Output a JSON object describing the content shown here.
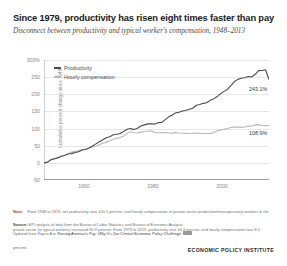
{
  "header": {
    "title": "Since 1979, productivity has risen eight times faster than pay",
    "subtitle": "Disconnect between productivity and typical worker's compensation, 1948–2013"
  },
  "legend": {
    "items": [
      {
        "label": "Productivity",
        "color": "#4d4d4d"
      },
      {
        "label": "Hourly compensation",
        "color": "#b8b8b8"
      }
    ]
  },
  "end_labels": {
    "productivity": "243.1%",
    "compensation": "108.9%"
  },
  "notes": {
    "lead": "Note:",
    "body": "From 1948 to 1973, net productivity rose 100.1 percent, and hourly compensation of private-sector production/nonsupervisory workers in the private sector (or typical workers) increased 90.9 percent. From 1979 to 2013, productivity rose 64.9 percent, and hourly compensation rose 8.2 percent."
  },
  "source": {
    "lead": "Source:",
    "body": "EPI analysis of data from the Bureau of Labor Statistics and Bureau of Economic Analysis"
  },
  "updated": {
    "prefix": "Updated from Figure A in",
    "em": "Raising America's Pay: Why It's Our Central Economic Policy Challenge"
  },
  "logo": "ECONOMIC POLICY INSTITUTE",
  "chart_data": {
    "type": "line",
    "title": "Since 1979, productivity has risen eight times faster than pay",
    "subtitle": "Disconnect between productivity and typical worker's compensation, 1948–2013",
    "xlabel": "",
    "ylabel": "Cumulative percent change since 1948",
    "xlim": [
      1948,
      2013
    ],
    "ylim": [
      -50,
      300
    ],
    "yticks": [
      -50,
      0,
      50,
      100,
      150,
      200,
      250,
      300
    ],
    "ytick_labels": [
      "-50",
      "0",
      "50",
      "100",
      "150",
      "200",
      "250",
      "300%"
    ],
    "xticks": [
      1960,
      1980,
      2000
    ],
    "xtick_labels": [
      "1960",
      "1980",
      "2000"
    ],
    "grid": true,
    "legend_position": "top-left",
    "series": [
      {
        "name": "Productivity",
        "color": "#4d4d4d",
        "end_value": 243.1,
        "x": [
          1948,
          1949,
          1950,
          1951,
          1952,
          1953,
          1954,
          1955,
          1956,
          1957,
          1958,
          1959,
          1960,
          1961,
          1962,
          1963,
          1964,
          1965,
          1966,
          1967,
          1968,
          1969,
          1970,
          1971,
          1972,
          1973,
          1974,
          1975,
          1976,
          1977,
          1978,
          1979,
          1980,
          1981,
          1982,
          1983,
          1984,
          1985,
          1986,
          1987,
          1988,
          1989,
          1990,
          1991,
          1992,
          1993,
          1994,
          1995,
          1996,
          1997,
          1998,
          1999,
          2000,
          2001,
          2002,
          2003,
          2004,
          2005,
          2006,
          2007,
          2008,
          2009,
          2010,
          2011,
          2012,
          2013
        ],
        "values": [
          0,
          1.6,
          9.4,
          12.0,
          14.5,
          19.4,
          21.3,
          26.5,
          27.0,
          30.1,
          32.6,
          37.4,
          39.2,
          43.6,
          49.3,
          55.4,
          61.8,
          67.3,
          73.3,
          76.4,
          82.1,
          83.6,
          85.6,
          91.5,
          97.8,
          100.1,
          97.0,
          100.7,
          107.3,
          110.8,
          113.7,
          114.1,
          113.0,
          117.3,
          117.5,
          126.2,
          134.2,
          139.0,
          145.7,
          147.6,
          151.3,
          153.6,
          156.5,
          159.4,
          168.0,
          170.3,
          173.6,
          175.4,
          182.3,
          186.5,
          193.3,
          201.4,
          208.5,
          214.2,
          225.2,
          237.1,
          243.5,
          246.9,
          248.2,
          252.0,
          250.5,
          258.3,
          268.9,
          269.4,
          271.6,
          243.1
        ]
      },
      {
        "name": "Hourly compensation",
        "color": "#b8b8b8",
        "end_value": 108.9,
        "x": [
          1948,
          1949,
          1950,
          1951,
          1952,
          1953,
          1954,
          1955,
          1956,
          1957,
          1958,
          1959,
          1960,
          1961,
          1962,
          1963,
          1964,
          1965,
          1966,
          1967,
          1968,
          1969,
          1970,
          1971,
          1972,
          1973,
          1974,
          1975,
          1976,
          1977,
          1978,
          1979,
          1980,
          1981,
          1982,
          1983,
          1984,
          1985,
          1986,
          1987,
          1988,
          1989,
          1990,
          1991,
          1992,
          1993,
          1994,
          1995,
          1996,
          1997,
          1998,
          1999,
          2000,
          2001,
          2002,
          2003,
          2004,
          2005,
          2006,
          2007,
          2008,
          2009,
          2010,
          2011,
          2012,
          2013
        ],
        "values": [
          0,
          3.0,
          8.4,
          11.3,
          14.6,
          19.8,
          22.4,
          26.5,
          31.4,
          33.4,
          34.9,
          38.8,
          40.6,
          43.4,
          46.4,
          48.9,
          53.0,
          56.9,
          60.5,
          63.6,
          69.1,
          71.6,
          73.7,
          78.1,
          86.0,
          90.9,
          87.6,
          86.9,
          89.7,
          91.3,
          92.3,
          93.4,
          88.6,
          87.6,
          87.8,
          88.3,
          87.0,
          86.3,
          88.9,
          87.3,
          86.3,
          86.0,
          85.8,
          85.9,
          87.2,
          86.5,
          85.7,
          85.5,
          85.9,
          88.0,
          93.3,
          95.8,
          97.7,
          100.2,
          102.9,
          104.5,
          104.1,
          103.6,
          104.6,
          107.3,
          106.8,
          110.8,
          111.5,
          108.9,
          108.6,
          108.9
        ]
      }
    ]
  }
}
